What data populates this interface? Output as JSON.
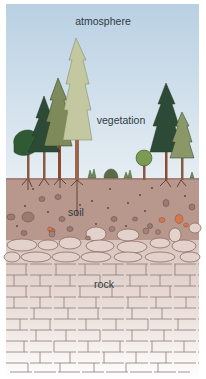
{
  "diagram": {
    "title": "",
    "layers": [
      {
        "id": "atmosphere",
        "label": "atmosphere",
        "color": "#c6d8e6"
      },
      {
        "id": "vegetation",
        "label": "vegetation",
        "color": "#3f5e3e"
      },
      {
        "id": "soil",
        "label": "soil",
        "color": "#b99a8d"
      },
      {
        "id": "rock",
        "label": "rock",
        "color": "#e6d6d0"
      }
    ]
  }
}
